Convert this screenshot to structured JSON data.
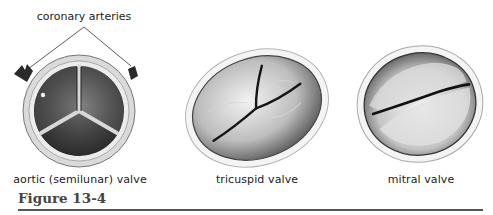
{
  "figure": {
    "caption": "Figure 13-4",
    "callout": "coronary arteries",
    "valves": [
      {
        "id": "aortic",
        "label": "aortic (semilunar) valve"
      },
      {
        "id": "tricuspid",
        "label": "tricuspid valve"
      },
      {
        "id": "mitral",
        "label": "mitral valve"
      }
    ]
  },
  "colors": {
    "ink": "#222222",
    "rule": "#555555",
    "caption": "#444444"
  }
}
